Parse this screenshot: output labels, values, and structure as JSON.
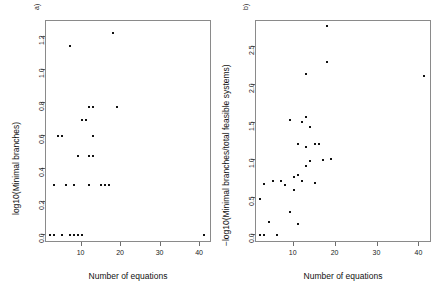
{
  "figure": {
    "width": 443,
    "height": 302,
    "background": "#ffffff",
    "point_color": "#111111"
  },
  "chart_data": [
    {
      "type": "scatter",
      "panel_label": "a)",
      "title": "",
      "xlabel": "Number of equations",
      "ylabel": "log10(Minimal branches)",
      "xlim": [
        1,
        43
      ],
      "ylim": [
        -0.05,
        1.3
      ],
      "xticks": [
        10,
        20,
        30,
        40
      ],
      "yticks": [
        0.0,
        0.2,
        0.4,
        0.6,
        0.8,
        1.0,
        1.2
      ],
      "ytick_labels": [
        "0.0",
        "0.2",
        "0.4",
        "0.6",
        "0.8",
        "1.0",
        "1.2"
      ],
      "xtick_labels": [
        "10",
        "20",
        "30",
        "40"
      ],
      "grid": false,
      "legend": "none",
      "x": [
        2,
        3,
        5,
        7,
        8,
        9,
        10,
        41,
        3,
        6,
        8,
        12,
        15,
        16,
        17,
        5,
        9,
        12,
        13,
        4,
        13,
        10,
        11,
        12,
        13,
        19,
        7,
        18
      ],
      "y": [
        0.0,
        0.0,
        0.0,
        0.0,
        0.0,
        0.0,
        0.0,
        0.0,
        0.3,
        0.3,
        0.3,
        0.3,
        0.3,
        0.3,
        0.3,
        0.6,
        0.48,
        0.48,
        0.48,
        0.6,
        0.6,
        0.7,
        0.7,
        0.78,
        0.78,
        0.78,
        1.15,
        1.23
      ]
    },
    {
      "type": "scatter",
      "panel_label": "b)",
      "title": "",
      "xlabel": "Number of equations",
      "ylabel": "−log10(Minimal branches/total feasible systems)",
      "xlim": [
        1,
        43
      ],
      "ylim": [
        -0.1,
        2.85
      ],
      "xticks": [
        10,
        20,
        30,
        40
      ],
      "yticks": [
        0.0,
        0.5,
        1.0,
        1.5,
        2.0,
        2.5
      ],
      "ytick_labels": [
        "0.0",
        "0.5",
        "1.0",
        "1.5",
        "2.0",
        "2.5"
      ],
      "xtick_labels": [
        "10",
        "20",
        "30",
        "40"
      ],
      "grid": false,
      "legend": "none",
      "x": [
        2,
        3,
        6,
        4,
        9,
        11,
        2,
        3,
        5,
        7,
        8,
        10,
        11,
        12,
        13,
        15,
        10,
        10,
        13,
        14,
        16,
        14,
        15,
        17,
        19,
        9,
        11,
        12,
        13,
        13,
        14,
        16,
        18,
        18,
        41
      ],
      "y": [
        0.01,
        0.01,
        0.01,
        0.18,
        0.31,
        0.15,
        0.48,
        0.69,
        0.72,
        0.73,
        0.67,
        0.78,
        0.8,
        0.72,
        0.92,
        0.7,
        0.6,
        0.6,
        1.17,
        0.99,
        1.21,
        1.44,
        1.21,
        1.0,
        1.02,
        1.53,
        1.21,
        1.51,
        1.58,
        2.14,
        1.44,
        1.21,
        2.78,
        2.3,
        2.12
      ]
    }
  ]
}
